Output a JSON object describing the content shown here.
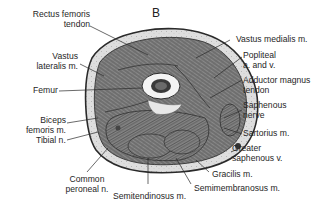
{
  "figure": {
    "panel_label": "B",
    "labels": {
      "rectus_femoris": [
        "Rectus femoris",
        "tendon"
      ],
      "vastus_lateralis": [
        "Vastus",
        "lateralis m."
      ],
      "femur": "Femur",
      "biceps_femoris": [
        "Biceps",
        "femoris m."
      ],
      "tibial_n": "Tibial n.",
      "common_peroneal": [
        "Common",
        "peroneal n."
      ],
      "semitendinosus": "Semitendinosus m.",
      "semimembranosus": "Semimembranosus m.",
      "gracilis": "Gracilis m.",
      "greater_saphenous": [
        "Greater",
        "saphenous v."
      ],
      "sartorius": "Sartorius m.",
      "saphenous_nerve": [
        "Saphenous",
        "nerve"
      ],
      "adductor_magnus": [
        "Adductor magnus",
        "tendon"
      ],
      "popliteal": [
        "Popliteal",
        "a. and v."
      ],
      "vastus_medialis": "Vastus medialis m."
    },
    "colors": {
      "outline": "#2a2a2a",
      "muscle": "#7a7a7a",
      "fat": "#d9d9d9",
      "bone": "#f4f4f4",
      "marrow": "#3a3a3a"
    }
  }
}
